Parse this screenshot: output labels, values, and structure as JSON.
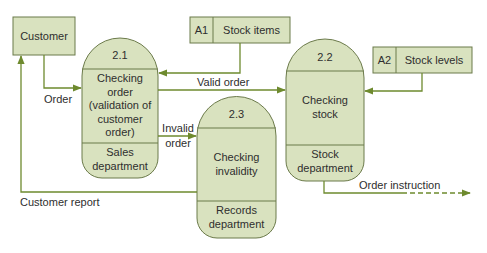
{
  "colors": {
    "fill": "#d9e2bf",
    "stroke": "#6b7a4a",
    "arrow": "#6e8a2e",
    "text": "#2e2e2e",
    "background": "#ffffff"
  },
  "entities": [
    {
      "id": "customer",
      "label": "Customer"
    }
  ],
  "processes": [
    {
      "id": "2.1",
      "number": "2.1",
      "name": "Checking order (validation of customer order)",
      "name_lines": [
        "Checking",
        "order",
        "(validation of",
        "customer",
        "order)"
      ],
      "location": "Sales department",
      "location_lines": [
        "Sales",
        "department"
      ]
    },
    {
      "id": "2.2",
      "number": "2.2",
      "name": "Checking stock",
      "name_lines": [
        "Checking",
        "stock"
      ],
      "location": "Stock department",
      "location_lines": [
        "Stock",
        "department"
      ]
    },
    {
      "id": "2.3",
      "number": "2.3",
      "name": "Checking invalidity",
      "name_lines": [
        "Checking",
        "invalidity"
      ],
      "location": "Records department",
      "location_lines": [
        "Records",
        "department"
      ]
    }
  ],
  "stores": [
    {
      "id": "A1",
      "code": "A1",
      "name": "Stock items"
    },
    {
      "id": "A2",
      "code": "A2",
      "name": "Stock levels"
    }
  ],
  "flows": [
    {
      "from": "Customer",
      "to": "2.1",
      "label": "Order",
      "style": "solid"
    },
    {
      "from": "A1",
      "to": "2.1",
      "label": "",
      "style": "solid"
    },
    {
      "from": "2.1",
      "to": "2.2",
      "label": "Valid order",
      "style": "solid"
    },
    {
      "from": "A2",
      "to": "2.2",
      "label": "",
      "style": "solid"
    },
    {
      "from": "2.1",
      "to": "2.3",
      "label": "Invalid order",
      "label_lines": [
        "Invalid",
        "order"
      ],
      "style": "solid"
    },
    {
      "from": "2.3",
      "to": "Customer",
      "label": "Customer report",
      "style": "solid"
    },
    {
      "from": "2.2",
      "to": "external",
      "label": "Order instruction",
      "style": "solid-then-dashed"
    }
  ]
}
